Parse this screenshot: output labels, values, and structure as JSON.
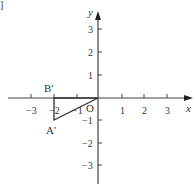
{
  "figure": {
    "axes": {
      "x_label": "x",
      "y_label": "y",
      "origin_label": "O",
      "x_ticks": [
        {
          "value": -3,
          "label": "−3"
        },
        {
          "value": -2,
          "label": "−2"
        },
        {
          "value": -1,
          "label": "−1"
        },
        {
          "value": 1,
          "label": "1"
        },
        {
          "value": 2,
          "label": "2"
        },
        {
          "value": 3,
          "label": "3"
        }
      ],
      "y_ticks": [
        {
          "value": 3,
          "label": "3"
        },
        {
          "value": 2,
          "label": "2"
        },
        {
          "value": 1,
          "label": "1"
        },
        {
          "value": -1,
          "label": "−1"
        },
        {
          "value": -2,
          "label": "−2"
        },
        {
          "value": -3,
          "label": "−3"
        }
      ]
    },
    "points": [
      {
        "name": "B'",
        "label": "B′",
        "x": -2,
        "y": 0
      },
      {
        "name": "A'",
        "label": "A′",
        "x": -2,
        "y": -1
      },
      {
        "name": "O",
        "label": "O",
        "x": 0,
        "y": 0
      }
    ],
    "triangle": [
      "O",
      "B'",
      "A'"
    ],
    "corner_mark": "]",
    "colors": {
      "axis": "#444444",
      "shape": "#333333",
      "text": "#333333"
    }
  }
}
